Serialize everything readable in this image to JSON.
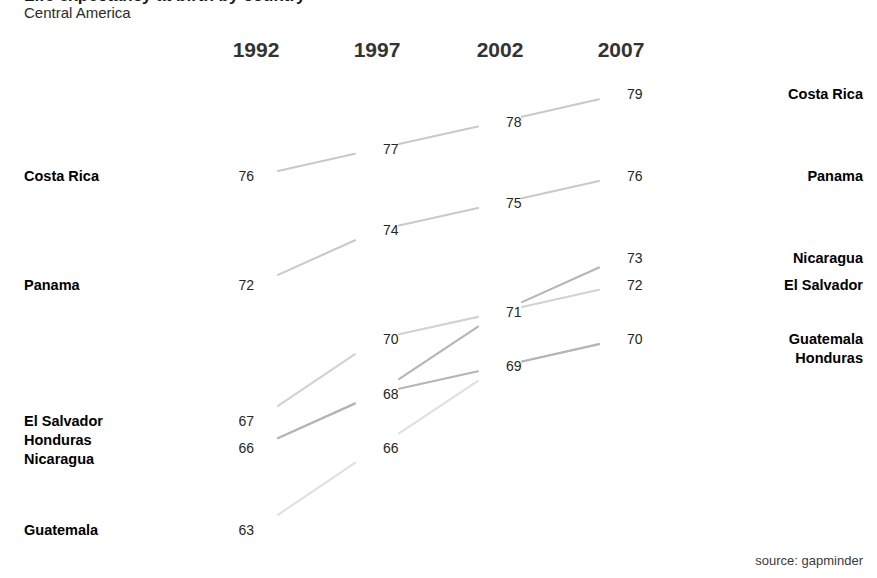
{
  "header": {
    "title": "Life expectancy at birth by country",
    "subtitle": "Central America",
    "source": "source: gapminder"
  },
  "chart_data": {
    "type": "line",
    "chart_style": "slopegraph",
    "title": "Life expectancy at birth by country",
    "subtitle": "Central America",
    "xlabel": "",
    "ylabel": "",
    "categories": [
      "1992",
      "1997",
      "2002",
      "2007"
    ],
    "ylim": [
      62,
      80
    ],
    "grid": false,
    "legend": "edge-labels",
    "annotation": "source: gapminder",
    "series": [
      {
        "name": "Costa Rica",
        "values": [
          76,
          77,
          78,
          79
        ],
        "color": "#c9c9c9"
      },
      {
        "name": "Panama",
        "values": [
          72,
          74,
          75,
          76
        ],
        "color": "#c9c9c9"
      },
      {
        "name": "Nicaragua",
        "values": [
          66,
          68,
          71,
          73
        ],
        "color": "#b5b5b5"
      },
      {
        "name": "El Salvador",
        "values": [
          67,
          70,
          71,
          72
        ],
        "color": "#d2d2d2"
      },
      {
        "name": "Guatemala",
        "values": [
          63,
          66,
          69,
          70
        ],
        "color": "#e0e0e0"
      },
      {
        "name": "Honduras",
        "values": [
          66,
          68,
          69,
          70
        ],
        "color": "#b5b5b5"
      }
    ]
  },
  "columns": [
    {
      "year": "1992",
      "x": 256
    },
    {
      "year": "1997",
      "x": 377
    },
    {
      "year": "2002",
      "x": 500
    },
    {
      "year": "2007",
      "x": 621
    }
  ],
  "left_labels": [
    {
      "names": [
        "Costa Rica"
      ],
      "value": 76
    },
    {
      "names": [
        "Panama"
      ],
      "value": 72
    },
    {
      "names": [
        "El Salvador",
        "Honduras",
        "Nicaragua"
      ],
      "value": 67
    },
    {
      "names": [
        "Guatemala"
      ],
      "value": 63
    }
  ],
  "right_labels": [
    {
      "names": [
        "Costa Rica"
      ],
      "value": 79
    },
    {
      "names": [
        "Panama"
      ],
      "value": 76
    },
    {
      "names": [
        "Nicaragua"
      ],
      "value": 73
    },
    {
      "names": [
        "El Salvador"
      ],
      "value": 72
    },
    {
      "names": [
        "Guatemala",
        "Honduras"
      ],
      "value": 70
    }
  ],
  "value_labels": {
    "1992": [
      76,
      72,
      67,
      66,
      63
    ],
    "1997": [
      77,
      74,
      70,
      68,
      66
    ],
    "2002": [
      78,
      75,
      71,
      69
    ],
    "2007": [
      79,
      76,
      73,
      72,
      70
    ]
  }
}
